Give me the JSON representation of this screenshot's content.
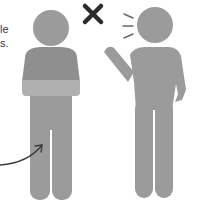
{
  "caption": {
    "line1": "le",
    "line2": "s."
  },
  "figures": [
    {
      "id": "left-person",
      "description": "person wearing shawl",
      "color": "#9b9b9b",
      "shawl_color": "#a9a9a9"
    },
    {
      "id": "right-person",
      "description": "person speaking and gesturing",
      "color": "#9b9b9b"
    }
  ],
  "symbols": {
    "cross": {
      "icon": "x-mark-icon",
      "color": "#2b2b2b"
    },
    "speech_lines": {
      "icon": "sound-lines-icon",
      "color": "#555555"
    },
    "arrow": {
      "icon": "curved-arrow-icon",
      "color": "#3a3a3a"
    }
  }
}
